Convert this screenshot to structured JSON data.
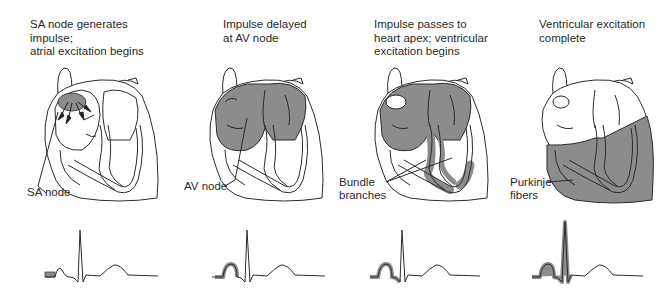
{
  "colors": {
    "excited": "#8c8c8c",
    "outline": "#2b2b2b",
    "background": "#ffffff"
  },
  "panels": [
    {
      "caption": "SA node generates impulse;\natrial excitation begins",
      "label": "SA node",
      "highlight": "sa-node"
    },
    {
      "caption": "Impulse delayed\nat AV node",
      "label": "AV node",
      "highlight": "atria"
    },
    {
      "caption": "Impulse passes to\nheart apex; ventricular\nexcitation begins",
      "label": "Bundle\nbranches",
      "highlight": "bundle-branches"
    },
    {
      "caption": "Ventricular excitation\ncomplete",
      "label": "Purkinje\nfibers",
      "highlight": "ventricles"
    }
  ],
  "ecg_segments": [
    {
      "highlighted": "P-onset"
    },
    {
      "highlighted": "P-wave"
    },
    {
      "highlighted": "P-wave + Q"
    },
    {
      "highlighted": "P-wave + QRS"
    }
  ]
}
